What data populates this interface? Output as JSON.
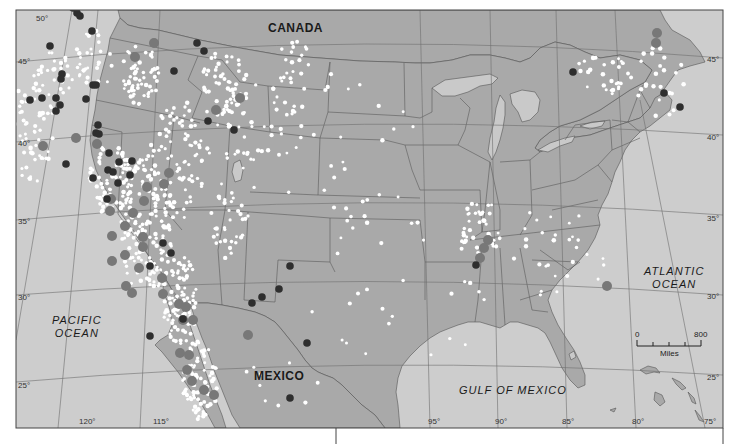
{
  "map": {
    "colors": {
      "water": "#cdcdcd",
      "land": "#a9a9a9",
      "lake": "#c9c9c9",
      "border": "#555555",
      "graticule": "#6e6e6e",
      "quake_small": "#ffffff",
      "quake_large_dark": "#2e2e2e",
      "quake_large_mid": "#787878",
      "frame": "#444444"
    },
    "labels": {
      "countries": [
        {
          "name": "CANADA",
          "x": 268,
          "y": 22
        },
        {
          "name": "MEXICO",
          "x": 254,
          "y": 370
        }
      ],
      "oceans": [
        {
          "name": "PACIFIC OCEAN",
          "line1": "PACIFIC",
          "line2": "OCEAN",
          "x": 52,
          "y": 314
        },
        {
          "name": "ATLANTIC OCEAN",
          "line1": "ATLANTIC",
          "line2": "OCEAN",
          "x": 644,
          "y": 265
        },
        {
          "name": "GULF OF MEXICO",
          "line1": "GULF OF MEXICO",
          "line2": "",
          "x": 459,
          "y": 384
        }
      ]
    },
    "graticule": {
      "latitudes": [
        {
          "label": "50°",
          "x": 36,
          "y": 15
        },
        {
          "label": "45°",
          "x": 18,
          "y": 62
        },
        {
          "label": "40°",
          "x": 18,
          "y": 144
        },
        {
          "label": "35°",
          "x": 18,
          "y": 220
        },
        {
          "label": "30°",
          "x": 18,
          "y": 296
        },
        {
          "label": "25°",
          "x": 18,
          "y": 385
        },
        {
          "label": "45°",
          "x": 709,
          "y": 62
        },
        {
          "label": "40°",
          "x": 709,
          "y": 138
        },
        {
          "label": "35°",
          "x": 709,
          "y": 219
        },
        {
          "label": "30°",
          "x": 709,
          "y": 297
        },
        {
          "label": "25°",
          "x": 709,
          "y": 377
        }
      ],
      "longitudes": [
        {
          "label": "120°",
          "x": 79,
          "y": 421
        },
        {
          "label": "115°",
          "x": 153,
          "y": 421
        },
        {
          "label": "95°",
          "x": 428,
          "y": 421
        },
        {
          "label": "90°",
          "x": 495,
          "y": 421
        },
        {
          "label": "85°",
          "x": 562,
          "y": 421
        },
        {
          "label": "80°",
          "x": 632,
          "y": 421
        },
        {
          "label": "75°",
          "x": 706,
          "y": 421
        }
      ]
    },
    "scale_bar": {
      "min_label": "0",
      "max_label": "800",
      "unit_label": "Miles"
    },
    "quakes_large_dark": [
      [
        50,
        46
      ],
      [
        66,
        6
      ],
      [
        73,
        8
      ],
      [
        77,
        13
      ],
      [
        80,
        16
      ],
      [
        92,
        31
      ],
      [
        62,
        74
      ],
      [
        61,
        79
      ],
      [
        42,
        98
      ],
      [
        30,
        100
      ],
      [
        56,
        98
      ],
      [
        60,
        105
      ],
      [
        56,
        111
      ],
      [
        86,
        99
      ],
      [
        93,
        85
      ],
      [
        96,
        85
      ],
      [
        98,
        125
      ],
      [
        96,
        133
      ],
      [
        99,
        134
      ],
      [
        66,
        164
      ],
      [
        93,
        178
      ],
      [
        109,
        153
      ],
      [
        108,
        170
      ],
      [
        113,
        172
      ],
      [
        119,
        162
      ],
      [
        132,
        161
      ],
      [
        118,
        183
      ],
      [
        107,
        199
      ],
      [
        130,
        175
      ],
      [
        163,
        243
      ],
      [
        171,
        253
      ],
      [
        150,
        266
      ],
      [
        183,
        319
      ],
      [
        197,
        43
      ],
      [
        204,
        51
      ],
      [
        174,
        71
      ],
      [
        208,
        121
      ],
      [
        234,
        130
      ],
      [
        290,
        266
      ],
      [
        279,
        289
      ],
      [
        262,
        297
      ],
      [
        252,
        303
      ],
      [
        307,
        343
      ],
      [
        290,
        398
      ],
      [
        573,
        72
      ],
      [
        664,
        93
      ],
      [
        680,
        107
      ],
      [
        476,
        265
      ],
      [
        150,
        336
      ]
    ],
    "quakes_large_mid": [
      [
        154,
        43
      ],
      [
        135,
        57
      ],
      [
        76,
        138
      ],
      [
        97,
        144
      ],
      [
        43,
        146
      ],
      [
        216,
        110
      ],
      [
        240,
        98
      ],
      [
        169,
        173
      ],
      [
        147,
        187
      ],
      [
        144,
        201
      ],
      [
        133,
        213
      ],
      [
        125,
        226
      ],
      [
        164,
        184
      ],
      [
        143,
        247
      ],
      [
        111,
        199
      ],
      [
        112,
        236
      ],
      [
        110,
        211
      ],
      [
        112,
        261
      ],
      [
        125,
        255
      ],
      [
        139,
        268
      ],
      [
        126,
        286
      ],
      [
        132,
        293
      ],
      [
        162,
        278
      ],
      [
        163,
        294
      ],
      [
        179,
        304
      ],
      [
        186,
        307
      ],
      [
        183,
        320
      ],
      [
        193,
        320
      ],
      [
        248,
        335
      ],
      [
        180,
        353
      ],
      [
        187,
        370
      ],
      [
        192,
        381
      ],
      [
        204,
        390
      ],
      [
        214,
        395
      ],
      [
        189,
        355
      ],
      [
        657,
        33
      ],
      [
        656,
        43
      ],
      [
        488,
        240
      ],
      [
        484,
        248
      ],
      [
        480,
        258
      ],
      [
        607,
        286
      ],
      [
        143,
        237
      ]
    ],
    "quakes_small_clusters": [
      {
        "cx": 32,
        "cy": 130,
        "rx": 22,
        "ry": 55,
        "n": 60
      },
      {
        "cx": 55,
        "cy": 75,
        "rx": 18,
        "ry": 25,
        "n": 25
      },
      {
        "cx": 95,
        "cy": 60,
        "rx": 20,
        "ry": 30,
        "n": 30
      },
      {
        "cx": 140,
        "cy": 75,
        "rx": 20,
        "ry": 30,
        "n": 60
      },
      {
        "cx": 145,
        "cy": 225,
        "rx": 28,
        "ry": 70,
        "n": 160
      },
      {
        "cx": 110,
        "cy": 180,
        "rx": 22,
        "ry": 35,
        "n": 70
      },
      {
        "cx": 180,
        "cy": 300,
        "rx": 18,
        "ry": 45,
        "n": 90
      },
      {
        "cx": 200,
        "cy": 380,
        "rx": 18,
        "ry": 40,
        "n": 90
      },
      {
        "cx": 180,
        "cy": 160,
        "rx": 30,
        "ry": 60,
        "n": 80
      },
      {
        "cx": 225,
        "cy": 90,
        "rx": 25,
        "ry": 40,
        "n": 60
      },
      {
        "cx": 260,
        "cy": 130,
        "rx": 40,
        "ry": 60,
        "n": 45
      },
      {
        "cx": 290,
        "cy": 60,
        "rx": 20,
        "ry": 25,
        "n": 20
      },
      {
        "cx": 230,
        "cy": 220,
        "rx": 20,
        "ry": 40,
        "n": 35
      },
      {
        "cx": 350,
        "cy": 150,
        "rx": 70,
        "ry": 90,
        "n": 35
      },
      {
        "cx": 480,
        "cy": 230,
        "rx": 22,
        "ry": 30,
        "n": 40
      },
      {
        "cx": 600,
        "cy": 75,
        "rx": 35,
        "ry": 20,
        "n": 30
      },
      {
        "cx": 660,
        "cy": 80,
        "rx": 25,
        "ry": 40,
        "n": 25
      },
      {
        "cx": 560,
        "cy": 250,
        "rx": 50,
        "ry": 50,
        "n": 30
      },
      {
        "cx": 400,
        "cy": 300,
        "rx": 90,
        "ry": 80,
        "n": 25
      },
      {
        "cx": 280,
        "cy": 380,
        "rx": 40,
        "ry": 30,
        "n": 10
      }
    ]
  }
}
